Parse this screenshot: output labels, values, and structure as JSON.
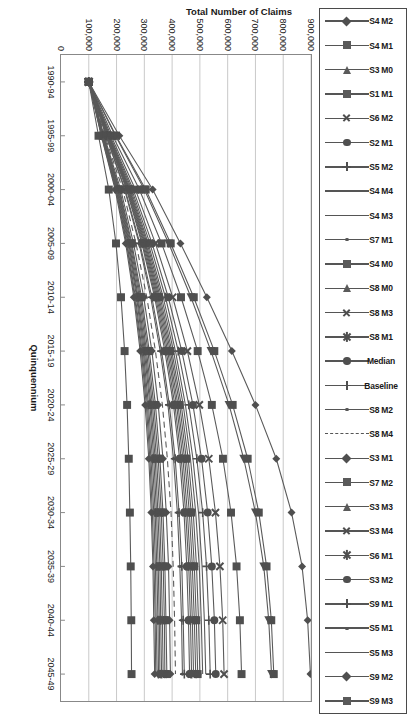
{
  "chart_data": {
    "type": "line",
    "title": "",
    "xlabel": "Quinquennium",
    "ylabel": "Total Number of Claims",
    "categories": [
      "1990-94",
      "1995-99",
      "2000-04",
      "2005-09",
      "2010-14",
      "2015-19",
      "2020-24",
      "2025-29",
      "2030-34",
      "2035-39",
      "2040-44",
      "2045-49"
    ],
    "ylim": [
      0,
      900000
    ],
    "yticks": [
      0,
      100000,
      200000,
      300000,
      400000,
      500000,
      600000,
      700000,
      800000,
      900000
    ],
    "ytick_labels": [
      "0",
      "100,000",
      "200,000",
      "300,000",
      "400,000",
      "500,000",
      "600,000",
      "700,000",
      "800,000",
      "900,000"
    ],
    "grid": true,
    "legend_position": "top",
    "series": [
      {
        "name": "S4 M2",
        "marker": "diamond",
        "values": [
          100000,
          210000,
          330000,
          430000,
          525000,
          615000,
          700000,
          775000,
          830000,
          868000,
          888000,
          898000
        ]
      },
      {
        "name": "S4 M1",
        "marker": "square",
        "values": [
          100000,
          198000,
          305000,
          395000,
          478000,
          552000,
          618000,
          672000,
          712000,
          740000,
          757000,
          766000
        ]
      },
      {
        "name": "S3 M0",
        "marker": "triangle",
        "values": [
          100000,
          196000,
          300000,
          388000,
          468000,
          540000,
          605000,
          658000,
          700000,
          730000,
          748000,
          758000
        ]
      },
      {
        "name": "S1 M1",
        "marker": "square",
        "values": [
          100000,
          186000,
          282000,
          362000,
          432000,
          492000,
          543000,
          583000,
          612000,
          632000,
          644000,
          650000
        ]
      },
      {
        "name": "S6 M2",
        "marker": "cross",
        "values": [
          100000,
          180000,
          268000,
          340000,
          402000,
          455000,
          498000,
          532000,
          556000,
          572000,
          582000,
          587000
        ]
      },
      {
        "name": "S2 M1",
        "marker": "circle",
        "values": [
          100000,
          176000,
          260000,
          328000,
          386000,
          435000,
          475000,
          506000,
          528000,
          543000,
          552000,
          557000
        ]
      },
      {
        "name": "S5 M2",
        "marker": "plus",
        "values": [
          100000,
          174000,
          255000,
          320000,
          376000,
          422000,
          460000,
          489000,
          510000,
          524000,
          532000,
          537000
        ]
      },
      {
        "name": "S4 M4",
        "marker": "none",
        "values": [
          100000,
          172000,
          251000,
          314000,
          368000,
          412000,
          448000,
          475000,
          495000,
          508000,
          516000,
          521000
        ]
      },
      {
        "name": "S4 M3",
        "marker": "none",
        "values": [
          100000,
          171000,
          248000,
          310000,
          362000,
          405000,
          440000,
          466000,
          485000,
          498000,
          505000,
          510000
        ]
      },
      {
        "name": "S7 M1",
        "marker": "dot",
        "values": [
          100000,
          170000,
          246000,
          306000,
          357000,
          399000,
          433000,
          458000,
          476000,
          488000,
          495000,
          500000
        ]
      },
      {
        "name": "S4 M0",
        "marker": "square",
        "values": [
          100000,
          169000,
          244000,
          303000,
          353000,
          394000,
          427000,
          451000,
          469000,
          480000,
          487000,
          492000
        ]
      },
      {
        "name": "S8 M0",
        "marker": "triangle",
        "values": [
          100000,
          168000,
          242000,
          300000,
          349000,
          389000,
          421000,
          445000,
          462000,
          473000,
          480000,
          485000
        ]
      },
      {
        "name": "S8 M3",
        "marker": "cross",
        "values": [
          100000,
          167000,
          240000,
          297000,
          345000,
          384000,
          416000,
          439000,
          455000,
          466000,
          473000,
          477000
        ]
      },
      {
        "name": "S8 M1",
        "marker": "star",
        "values": [
          100000,
          166000,
          238000,
          294000,
          341000,
          379000,
          410000,
          433000,
          449000,
          460000,
          466000,
          470000
        ]
      },
      {
        "name": "Median",
        "marker": "circle",
        "values": [
          100000,
          165000,
          236000,
          291000,
          337000,
          374000,
          405000,
          427000,
          443000,
          453000,
          459000,
          463000
        ]
      },
      {
        "name": "Baseline",
        "marker": "plus",
        "values": [
          100000,
          163000,
          231000,
          284000,
          327000,
          362000,
          390000,
          411000,
          425000,
          435000,
          440000,
          444000
        ]
      },
      {
        "name": "S8 M2",
        "marker": "dot",
        "values": [
          100000,
          162000,
          229000,
          281000,
          323000,
          357000,
          385000,
          405000,
          419000,
          428000,
          434000,
          437000
        ]
      },
      {
        "name": "S8 M4",
        "marker": "dash",
        "values": [
          100000,
          158000,
          222000,
          270000,
          309000,
          340000,
          365000,
          383000,
          396000,
          404000,
          409000,
          412000
        ]
      },
      {
        "name": "S3 M1",
        "marker": "diamond",
        "values": [
          100000,
          155000,
          215000,
          261000,
          298000,
          327000,
          350000,
          367000,
          379000,
          387000,
          391000,
          394000
        ]
      },
      {
        "name": "S7 M2",
        "marker": "square",
        "values": [
          100000,
          153000,
          211000,
          255000,
          290000,
          318000,
          340000,
          356000,
          367000,
          374000,
          378000,
          381000
        ]
      },
      {
        "name": "S3 M3",
        "marker": "triangle",
        "values": [
          100000,
          152000,
          209000,
          252000,
          286000,
          313000,
          334000,
          350000,
          361000,
          368000,
          372000,
          374000
        ]
      },
      {
        "name": "S3 M4",
        "marker": "cross",
        "values": [
          100000,
          151000,
          207000,
          249000,
          282000,
          308000,
          329000,
          344000,
          355000,
          361000,
          365000,
          368000
        ]
      },
      {
        "name": "S6 M1",
        "marker": "star",
        "values": [
          100000,
          150000,
          205000,
          246000,
          278000,
          304000,
          324000,
          339000,
          349000,
          356000,
          359000,
          362000
        ]
      },
      {
        "name": "S3 M2",
        "marker": "circle",
        "values": [
          100000,
          149000,
          203000,
          244000,
          275000,
          300000,
          320000,
          334000,
          344000,
          350000,
          354000,
          356000
        ]
      },
      {
        "name": "S9 M1",
        "marker": "plus",
        "values": [
          100000,
          148000,
          201000,
          241000,
          272000,
          296000,
          315000,
          329000,
          339000,
          345000,
          349000,
          351000
        ]
      },
      {
        "name": "S5 M1",
        "marker": "dot",
        "values": [
          100000,
          147000,
          199000,
          238000,
          268000,
          292000,
          311000,
          324000,
          334000,
          340000,
          343000,
          346000
        ]
      },
      {
        "name": "S5 M3",
        "marker": "none",
        "values": [
          100000,
          146000,
          197000,
          236000,
          265000,
          289000,
          307000,
          320000,
          329000,
          335000,
          339000,
          341000
        ]
      },
      {
        "name": "S9 M2",
        "marker": "diamond",
        "values": [
          100000,
          145000,
          195000,
          233000,
          262000,
          285000,
          303000,
          316000,
          325000,
          331000,
          334000,
          337000
        ]
      },
      {
        "name": "S9 M3",
        "marker": "square",
        "values": [
          100000,
          135000,
          172000,
          198000,
          216000,
          229000,
          238000,
          244000,
          248000,
          251000,
          253000,
          254000
        ]
      }
    ]
  },
  "legend": {
    "items": [
      {
        "label": "S4 M2",
        "marker": "diamond"
      },
      {
        "label": "S4 M1",
        "marker": "square"
      },
      {
        "label": "S3 M0",
        "marker": "triangle"
      },
      {
        "label": "S1 M1",
        "marker": "square"
      },
      {
        "label": "S6 M2",
        "marker": "cross"
      },
      {
        "label": "S2 M1",
        "marker": "circle"
      },
      {
        "label": "S5 M2",
        "marker": "plus"
      },
      {
        "label": "S4 M4",
        "marker": "none"
      },
      {
        "label": "S4 M3",
        "marker": "none"
      },
      {
        "label": "S7 M1",
        "marker": "dot"
      },
      {
        "label": "S4 M0",
        "marker": "square"
      },
      {
        "label": "S8 M0",
        "marker": "triangle"
      },
      {
        "label": "S8 M3",
        "marker": "cross"
      },
      {
        "label": "S8 M1",
        "marker": "star"
      },
      {
        "label": "Median",
        "marker": "circle"
      },
      {
        "label": "Baseline",
        "marker": "plus"
      },
      {
        "label": "S8 M2",
        "marker": "dot"
      },
      {
        "label": "S8 M4",
        "marker": "dash"
      },
      {
        "label": "S3 M1",
        "marker": "diamond"
      },
      {
        "label": "S7 M2",
        "marker": "square"
      },
      {
        "label": "S3 M3",
        "marker": "triangle"
      },
      {
        "label": "S3 M4",
        "marker": "cross"
      },
      {
        "label": "S6 M1",
        "marker": "star"
      },
      {
        "label": "S3 M2",
        "marker": "circle"
      },
      {
        "label": "S9 M1",
        "marker": "plus"
      },
      {
        "label": "S5 M1",
        "marker": "dot"
      },
      {
        "label": "S5 M3",
        "marker": "none"
      },
      {
        "label": "S9 M2",
        "marker": "diamond"
      },
      {
        "label": "S9 M3",
        "marker": "square"
      }
    ]
  },
  "colors": {
    "line": "#5a5a5a",
    "marker": "#4f4f4f",
    "grid": "#c9c9c9",
    "axis": "#888888",
    "text": "#1a1a1a"
  }
}
